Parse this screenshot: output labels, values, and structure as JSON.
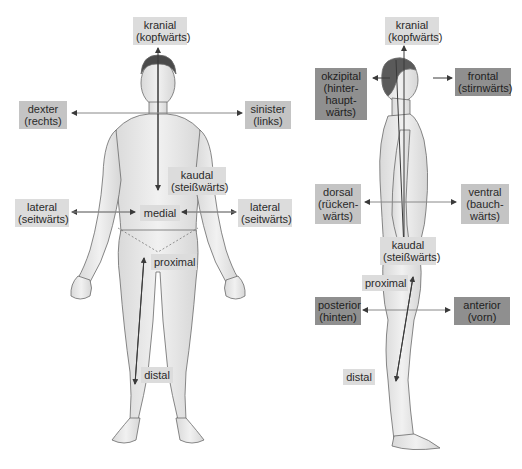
{
  "diagram": {
    "title": "",
    "front_view": {
      "labels": {
        "kranial": {
          "term": "kranial",
          "translation": "(kopfwärts)"
        },
        "dexter": {
          "term": "dexter",
          "translation": "(rechts)"
        },
        "sinister": {
          "term": "sinister",
          "translation": "(links)"
        },
        "kaudal": {
          "term": "kaudal",
          "translation": "(steißwärts)"
        },
        "lateral_left": {
          "term": "lateral",
          "translation": "(seitwärts)"
        },
        "lateral_right": {
          "term": "lateral",
          "translation": "(seitwärts)"
        },
        "medial": {
          "term": "medial"
        },
        "proximal": {
          "term": "proximal"
        },
        "distal": {
          "term": "distal"
        }
      }
    },
    "side_view": {
      "labels": {
        "kranial": {
          "term": "kranial",
          "translation": "(kopfwärts)"
        },
        "okzipital": {
          "term": "okzipital",
          "translation_lines": [
            "(hinter-",
            "haupt-",
            "wärts)"
          ]
        },
        "frontal": {
          "term": "frontal",
          "translation": "(stirnwärts)"
        },
        "dorsal": {
          "term": "dorsal",
          "translation_lines": [
            "(rücken-",
            "wärts)"
          ]
        },
        "ventral": {
          "term": "ventral",
          "translation_lines": [
            "(bauch-",
            "wärts)"
          ]
        },
        "kaudal": {
          "term": "kaudal",
          "translation": "(steißwärts)"
        },
        "proximal": {
          "term": "proximal"
        },
        "posterior": {
          "term": "posterior",
          "translation": "(hinten)"
        },
        "anterior": {
          "term": "anterior",
          "translation": "(vorn)"
        },
        "distal": {
          "term": "distal"
        }
      }
    },
    "colors": {
      "label_light": "#dcdcdc",
      "label_mid": "#c4c4c4",
      "label_dark": "#8f8f8f",
      "body_fill": "#e9e9e9",
      "body_outline": "#6a6a6a",
      "arrow": "#3a3a3a"
    }
  }
}
